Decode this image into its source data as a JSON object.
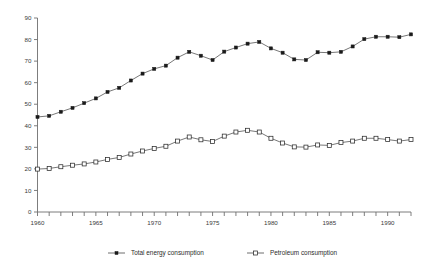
{
  "chart_data": {
    "type": "line",
    "title": "",
    "subtitle": "",
    "xlabel": "",
    "ylabel": "",
    "xlim": [
      1960,
      1992
    ],
    "ylim": [
      0,
      90
    ],
    "yticks": [
      0,
      10,
      20,
      30,
      40,
      50,
      60,
      70,
      80,
      90
    ],
    "ytick_labels": [
      "0",
      "10",
      "20",
      "30",
      "40",
      "50",
      "60",
      "70",
      "80",
      "90"
    ],
    "xticks": [
      1960,
      1961,
      1962,
      1963,
      1964,
      1965,
      1966,
      1967,
      1968,
      1969,
      1970,
      1971,
      1972,
      1973,
      1974,
      1975,
      1976,
      1977,
      1978,
      1979,
      1980,
      1981,
      1982,
      1983,
      1984,
      1985,
      1986,
      1987,
      1988,
      1989,
      1990,
      1991,
      1992
    ],
    "xtick_labels_shown": [
      "1960",
      "1965",
      "1970",
      "1975",
      "1980",
      "1985",
      "1990"
    ],
    "xtick_labels_values": [
      1960,
      1965,
      1970,
      1975,
      1980,
      1985,
      1990
    ],
    "grid": false,
    "legend_position": "bottom",
    "x": [
      1960,
      1961,
      1962,
      1963,
      1964,
      1965,
      1966,
      1967,
      1968,
      1969,
      1970,
      1971,
      1972,
      1973,
      1974,
      1975,
      1976,
      1977,
      1978,
      1979,
      1980,
      1981,
      1982,
      1983,
      1984,
      1985,
      1986,
      1987,
      1988,
      1989,
      1990,
      1991,
      1992
    ],
    "series": [
      {
        "name": "Total energy consumption",
        "marker": "filled-square",
        "values": [
          44.1,
          44.6,
          46.5,
          48.3,
          50.5,
          52.7,
          55.7,
          57.6,
          61.0,
          64.2,
          66.4,
          67.9,
          71.6,
          74.3,
          72.5,
          70.5,
          74.4,
          76.3,
          78.1,
          78.9,
          75.9,
          73.9,
          70.8,
          70.5,
          74.1,
          73.9,
          74.3,
          76.8,
          80.2,
          81.3,
          81.3,
          81.1,
          82.4
        ]
      },
      {
        "name": "Petroleum consumption",
        "marker": "open-square",
        "values": [
          19.9,
          20.2,
          21.0,
          21.7,
          22.3,
          23.2,
          24.4,
          25.3,
          26.9,
          28.3,
          29.5,
          30.5,
          32.9,
          34.8,
          33.5,
          32.7,
          35.2,
          37.1,
          37.9,
          37.1,
          34.2,
          32.0,
          30.2,
          30.1,
          31.1,
          30.9,
          32.2,
          32.9,
          34.2,
          34.2,
          33.6,
          32.9,
          33.6
        ]
      }
    ],
    "legend": [
      {
        "label": "Total energy consumption",
        "marker": "filled-square"
      },
      {
        "label": "Petroleum consumption",
        "marker": "open-square"
      }
    ]
  }
}
